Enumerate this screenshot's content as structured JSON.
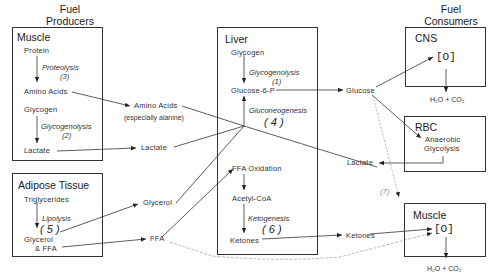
{
  "headers": {
    "producers": [
      "Fuel",
      "Producers"
    ],
    "consumers": [
      "Fuel",
      "Consumers"
    ]
  },
  "muscle_producer": {
    "title": "Muscle",
    "protein": "Protein",
    "proteolysis": "Proteolysis",
    "proteolysis_num": "(3)",
    "amino_acids": "Amino  Acids",
    "glycogen": "Glycogen",
    "glycogenolysis": "Glycogenolysis",
    "glycogenolysis_num": "(2)",
    "lactate": "Lactate"
  },
  "adipose": {
    "title": "Adipose Tissue",
    "triglycerides": "Triglycerides",
    "lipolysis": "Lipolysis",
    "lipolysis_num": "( 5 )",
    "glycerol": "Glycerol",
    "ffa": "& FFA"
  },
  "middle": {
    "amino_acids": "Amino Acids",
    "amino_note": "(especially alanine)",
    "lactate": "Lactate",
    "glycerol": "Glycerol",
    "ffa": "FFA"
  },
  "liver": {
    "title": "Liver",
    "glycogen": "Glycogen",
    "glycogenolysis": "Glycogenolysis",
    "glycogenolysis_num": "(1)",
    "g6p": "Glucose-6-P",
    "gluconeogenesis": "Gluconeogenesis",
    "gluconeogenesis_num": "( 4 )",
    "ffa_oxidation": "FFA Oxidation",
    "acetyl_coa": "Acetyl-CoA",
    "ketogenesis": "Ketogenesis",
    "ketogenesis_num": "( 6 )",
    "ketones": "Ketones"
  },
  "right_middle": {
    "glucose": "Glucose",
    "lactate": "Lactate",
    "ketones": "Ketones",
    "pathway_num": "(7)"
  },
  "cns": {
    "title": "CNS",
    "oxidation": "[O]",
    "products": "H₂O + CO₂"
  },
  "rbc": {
    "title": "RBC",
    "process_line1": "Anaerobic",
    "process_line2": "Glycolysis"
  },
  "muscle_consumer": {
    "title": "Muscle",
    "oxidation": "[O]",
    "products": "H₂O + CO₂"
  },
  "colors": {
    "line": "#333333",
    "faint_line": "#999999",
    "background": "#ffffff"
  }
}
